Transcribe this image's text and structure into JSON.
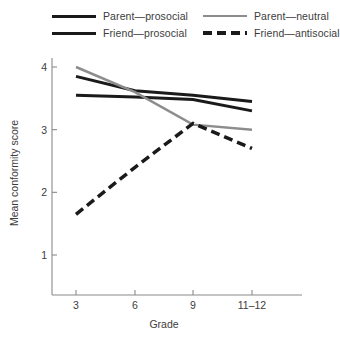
{
  "legend": {
    "items": [
      {
        "label": "Parent—prosocial",
        "style": "solid",
        "color": "#1a1a1a",
        "width": 3.0
      },
      {
        "label": "Friend—prosocial",
        "style": "solid",
        "color": "#1a1a1a",
        "width": 3.0
      },
      {
        "label": "Parent—neutral",
        "style": "solid",
        "color": "#8d8d8d",
        "width": 2.5
      },
      {
        "label": "Friend—antisocial",
        "style": "dashed",
        "color": "#1a1a1a",
        "width": 3.5
      }
    ]
  },
  "axes": {
    "x_title": "Grade",
    "y_title": "Mean conformity score",
    "x_ticks": [
      "3",
      "6",
      "9",
      "11–12"
    ],
    "y_ticks": [
      "1",
      "2",
      "3",
      "4"
    ]
  },
  "chart_data": {
    "type": "line",
    "title": "",
    "xlabel": "Grade",
    "ylabel": "Mean conformity score",
    "categories": [
      "3",
      "6",
      "9",
      "11–12"
    ],
    "x": [
      3,
      6,
      9,
      11.5
    ],
    "ylim": [
      0.55,
      4.3
    ],
    "yticks": [
      1,
      2,
      3,
      4
    ],
    "grid": false,
    "legend_position": "top",
    "series": [
      {
        "name": "Parent—prosocial",
        "values": [
          3.85,
          3.62,
          3.55,
          3.45
        ],
        "color": "#1a1a1a",
        "style": "solid",
        "width": 3.0
      },
      {
        "name": "Friend—prosocial",
        "values": [
          3.55,
          3.52,
          3.48,
          3.3
        ],
        "color": "#1a1a1a",
        "style": "solid",
        "width": 3.0
      },
      {
        "name": "Parent—neutral",
        "values": [
          4.0,
          3.6,
          3.08,
          3.0
        ],
        "color": "#8d8d8d",
        "style": "solid",
        "width": 2.5
      },
      {
        "name": "Friend—antisocial",
        "values": [
          1.65,
          2.4,
          3.1,
          2.7
        ],
        "color": "#1a1a1a",
        "style": "dashed",
        "width": 3.5
      }
    ]
  },
  "geometry": {
    "plot_left": 55,
    "plot_right": 300,
    "x_pixels": [
      76,
      135,
      193,
      252
    ],
    "y_value_top": 4,
    "y_pixel_top": 19,
    "y_value_bottom": 1,
    "y_pixel_bottom": 207,
    "axis_x_pixel": 52,
    "axis_y_pixel": 247,
    "axis_top_pixel": 10,
    "axis_right_pixel": 302
  }
}
